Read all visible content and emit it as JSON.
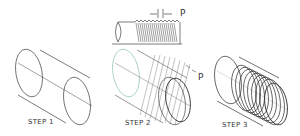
{
  "figure": {
    "pitch_symbol": "P",
    "steps": [
      {
        "label": "STEP 1",
        "description": "Cylinder with axis and end ellipses"
      },
      {
        "label": "STEP 2",
        "description": "Pitch lines P spaced along cylinder"
      },
      {
        "label": "STEP 3",
        "description": "Thread crests drawn as ellipses"
      }
    ],
    "top_detail": {
      "label": "P",
      "description": "Threaded rod side view with pitch dimension"
    }
  },
  "colors": {
    "line": "#333333",
    "construction": "#7fb8a8",
    "light": "#999999",
    "background": "#ffffff"
  }
}
